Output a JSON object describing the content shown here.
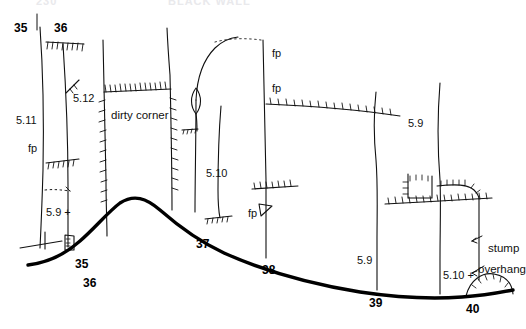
{
  "page": {
    "background_color": "#ffffff",
    "ink_color": "#000000",
    "width": 520,
    "height": 329
  },
  "header": {
    "left_ghost": "230",
    "right_ghost": "BLACK WALL"
  },
  "top_route_numbers": [
    {
      "label": "35",
      "x": 14,
      "y": 22
    },
    {
      "label": "36",
      "x": 54,
      "y": 22
    }
  ],
  "bottom_route_numbers": [
    {
      "label": "35",
      "x": 75,
      "y": 258
    },
    {
      "label": "36",
      "x": 83,
      "y": 277
    },
    {
      "label": "37",
      "x": 196,
      "y": 238
    },
    {
      "label": "38",
      "x": 262,
      "y": 264
    },
    {
      "label": "39",
      "x": 369,
      "y": 297
    },
    {
      "label": "40",
      "x": 466,
      "y": 303
    }
  ],
  "grades": [
    {
      "label": "5.11",
      "x": 16,
      "y": 115
    },
    {
      "label": "5.12",
      "x": 73,
      "y": 93
    },
    {
      "label": "5.9 +",
      "x": 46,
      "y": 207
    },
    {
      "label": "5.10",
      "x": 206,
      "y": 168
    },
    {
      "label": "5.9",
      "x": 408,
      "y": 118
    },
    {
      "label": "5.9",
      "x": 357,
      "y": 255
    },
    {
      "label": "5.10 +",
      "x": 443,
      "y": 270
    }
  ],
  "fixed_pin_labels": [
    {
      "label": "fp",
      "x": 28,
      "y": 143
    },
    {
      "label": "fp",
      "x": 272,
      "y": 48
    },
    {
      "label": "fp",
      "x": 272,
      "y": 83
    },
    {
      "label": "fp",
      "x": 248,
      "y": 208
    }
  ],
  "feature_notes": [
    {
      "label": "dirty corner",
      "x": 111,
      "y": 110
    },
    {
      "label": "stump",
      "x": 488,
      "y": 243
    },
    {
      "label": "overhang",
      "x": 478,
      "y": 264
    }
  ],
  "legend_semantics": {
    "fp": "fixed pin",
    "hatched_line": "roof / overhang",
    "dotted_line": "hidden or indefinite edge",
    "heavy_line": "ground / talus line"
  }
}
